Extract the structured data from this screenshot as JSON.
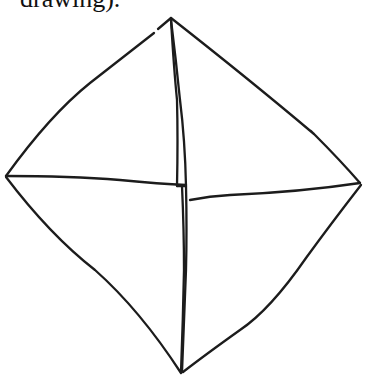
{
  "caption": {
    "text": "drawing)."
  },
  "figure": {
    "stroke_color": "#1c1c1c",
    "background": "#ffffff",
    "vertices": {
      "top": [
        171,
        18
      ],
      "right": [
        360,
        183
      ],
      "bottom": [
        182,
        373
      ],
      "left": [
        5,
        176
      ]
    }
  }
}
